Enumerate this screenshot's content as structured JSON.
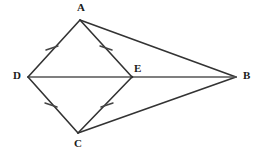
{
  "figure": {
    "background_color": "#ffffff",
    "stroke_color": "#333333",
    "diagonal_stroke_color": "#555555",
    "tick_color": "#444444"
  },
  "points": [
    {
      "name": "A",
      "label": "A",
      "x": 80,
      "y": 20,
      "label_x": 77,
      "label_y": 2
    },
    {
      "name": "B",
      "label": "B",
      "x": 236,
      "y": 77,
      "label_x": 243,
      "label_y": 70
    },
    {
      "name": "C",
      "label": "C",
      "x": 78,
      "y": 133,
      "label_x": 74,
      "label_y": 138
    },
    {
      "name": "D",
      "label": "D",
      "x": 28,
      "y": 77,
      "label_x": 13,
      "label_y": 70
    },
    {
      "name": "E",
      "label": "E",
      "x": 132,
      "y": 77,
      "label_x": 134,
      "label_y": 63
    }
  ],
  "segments": [
    {
      "name": "segment-DA",
      "from": "D",
      "to": "A",
      "style": "solid",
      "ticks": 1
    },
    {
      "name": "segment-AE",
      "from": "A",
      "to": "E",
      "style": "solid",
      "ticks": 1
    },
    {
      "name": "segment-DC",
      "from": "D",
      "to": "C",
      "style": "solid",
      "ticks": 1
    },
    {
      "name": "segment-CE",
      "from": "C",
      "to": "E",
      "style": "solid",
      "ticks": 1
    },
    {
      "name": "segment-AB",
      "from": "A",
      "to": "B",
      "style": "solid",
      "ticks": 0
    },
    {
      "name": "segment-CB",
      "from": "C",
      "to": "B",
      "style": "solid",
      "ticks": 0
    },
    {
      "name": "segment-DB",
      "from": "D",
      "to": "B",
      "style": "solid",
      "ticks": 0
    }
  ],
  "tick_marks": [
    {
      "name": "tick-DA",
      "on": "segment-DA",
      "x": 52,
      "y": 48
    },
    {
      "name": "tick-AE",
      "on": "segment-AE",
      "x": 106,
      "y": 48
    },
    {
      "name": "tick-DC",
      "on": "segment-DC",
      "x": 51,
      "y": 105
    },
    {
      "name": "tick-CE",
      "on": "segment-CE",
      "x": 107,
      "y": 105
    }
  ]
}
